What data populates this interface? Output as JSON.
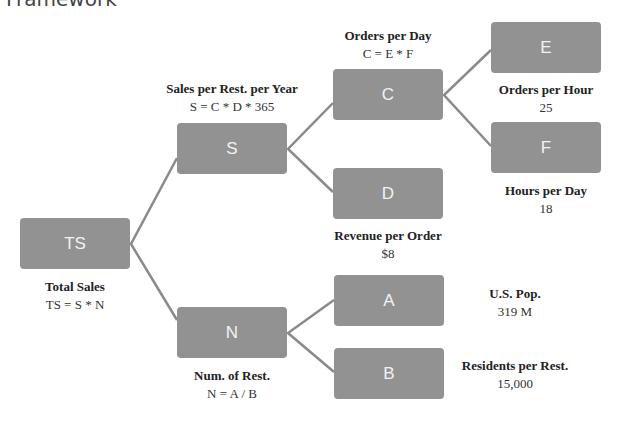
{
  "title": "Framework",
  "nodes": {
    "TS": {
      "label": "TS",
      "name": "Total Sales",
      "formula": "TS = S * N"
    },
    "S": {
      "label": "S",
      "name": "Sales per Rest. per Year",
      "formula": "S = C * D * 365"
    },
    "N": {
      "label": "N",
      "name": "Num. of Rest.",
      "formula": "N = A / B"
    },
    "C": {
      "label": "C",
      "name": "Orders per Day",
      "formula": "C = E * F"
    },
    "D": {
      "label": "D",
      "name": "Revenue per Order",
      "value": "$8"
    },
    "E": {
      "label": "E",
      "name": "Orders per Hour",
      "value": "25"
    },
    "F": {
      "label": "F",
      "name": "Hours per Day",
      "value": "18"
    },
    "A": {
      "label": "A",
      "name": "U.S. Pop.",
      "value": "319 M"
    },
    "B": {
      "label": "B",
      "name": "Residents per Rest.",
      "value": "15,000"
    }
  },
  "colors": {
    "box": "#929292",
    "line": "#8a8a8a",
    "box_text": "#f2f2f2"
  }
}
